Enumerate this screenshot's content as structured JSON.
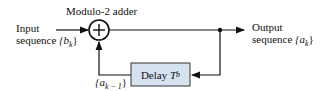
{
  "adder": {
    "label": "Modulo-2 adder",
    "symbol": "+"
  },
  "input": {
    "line1": "Input",
    "line2": "sequence",
    "var": "{b",
    "sub": "k",
    "close": "}"
  },
  "output": {
    "line1": "Output",
    "line2": "sequence",
    "var": "{a",
    "sub": "k",
    "close": "}"
  },
  "delay": {
    "label": "Delay",
    "var": "T",
    "sub": "b"
  },
  "feedback": {
    "var": "{a",
    "sub": "k − 1",
    "close": "}"
  },
  "colors": {
    "box_fill": "#d6e2ef",
    "line": "#111111"
  }
}
